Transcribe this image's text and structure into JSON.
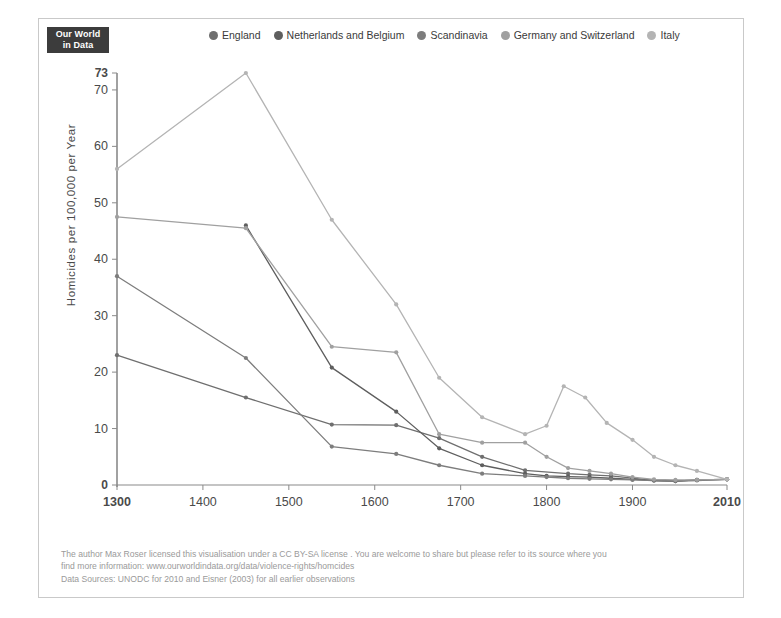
{
  "logo": {
    "line1": "Our World",
    "line2": "in Data"
  },
  "legend": {
    "position": "top",
    "items": [
      {
        "label": "England",
        "color": "#6f6f6f"
      },
      {
        "label": "Netherlands and Belgium",
        "color": "#5e5e5e"
      },
      {
        "label": "Scandinavia",
        "color": "#7d7d7d"
      },
      {
        "label": "Germany and Switzerland",
        "color": "#a0a0a0"
      },
      {
        "label": "Italy",
        "color": "#b4b4b4"
      }
    ]
  },
  "axes": {
    "ylabel": "Homicides per 100,000 per Year",
    "yticks": [
      "0",
      "10",
      "20",
      "30",
      "40",
      "50",
      "60",
      "70",
      "73"
    ],
    "xticks": [
      "1300",
      "1400",
      "1500",
      "1600",
      "1700",
      "1800",
      "1900",
      "2010"
    ]
  },
  "footer": {
    "line1": "The author Max Roser licensed this visualisation under a CC BY-SA license . You are welcome to share but please refer to its source where you",
    "line2": "find more information: www.ourworldindata.org/data/violence-rights/homcides",
    "line3": "Data Sources: UNODC for 2010 and Eisner (2003) for all earlier observations"
  },
  "chart_data": {
    "type": "line",
    "title": "",
    "xlabel": "",
    "ylabel": "Homicides per 100,000 per Year",
    "xlim": [
      1300,
      2010
    ],
    "ylim": [
      0,
      73
    ],
    "grid": false,
    "legend_position": "top",
    "yticks": [
      0,
      10,
      20,
      30,
      40,
      50,
      60,
      70,
      73
    ],
    "xticks": [
      1300,
      1400,
      1500,
      1600,
      1700,
      1800,
      1900,
      2010
    ],
    "series": [
      {
        "name": "England",
        "color": "#6f6f6f",
        "points": [
          [
            1300,
            23.0
          ],
          [
            1450,
            15.5
          ],
          [
            1550,
            10.7
          ],
          [
            1625,
            10.6
          ],
          [
            1675,
            8.3
          ],
          [
            1725,
            5.0
          ],
          [
            1775,
            2.6
          ],
          [
            1825,
            2.0
          ],
          [
            1850,
            1.8
          ],
          [
            1875,
            1.6
          ],
          [
            1900,
            1.2
          ],
          [
            1925,
            0.8
          ],
          [
            1950,
            0.7
          ],
          [
            1975,
            0.8
          ],
          [
            2010,
            1.0
          ]
        ]
      },
      {
        "name": "Netherlands and Belgium",
        "color": "#5e5e5e",
        "points": [
          [
            1450,
            46.0
          ],
          [
            1550,
            20.8
          ],
          [
            1625,
            13.0
          ],
          [
            1675,
            6.5
          ],
          [
            1725,
            3.5
          ],
          [
            1775,
            2.0
          ],
          [
            1800,
            1.6
          ],
          [
            1825,
            1.5
          ],
          [
            1850,
            1.4
          ],
          [
            1875,
            1.2
          ],
          [
            1900,
            1.0
          ],
          [
            1925,
            0.8
          ],
          [
            1950,
            0.7
          ],
          [
            1975,
            0.9
          ],
          [
            2010,
            1.0
          ]
        ]
      },
      {
        "name": "Scandinavia",
        "color": "#7d7d7d",
        "points": [
          [
            1300,
            37.0
          ],
          [
            1450,
            22.5
          ],
          [
            1550,
            6.8
          ],
          [
            1625,
            5.5
          ],
          [
            1675,
            3.5
          ],
          [
            1725,
            2.0
          ],
          [
            1775,
            1.6
          ],
          [
            1800,
            1.4
          ],
          [
            1825,
            1.2
          ],
          [
            1850,
            1.1
          ],
          [
            1875,
            1.0
          ],
          [
            1900,
            0.9
          ],
          [
            1925,
            0.8
          ],
          [
            1950,
            0.7
          ],
          [
            1975,
            0.9
          ],
          [
            2010,
            1.0
          ]
        ]
      },
      {
        "name": "Germany and Switzerland",
        "color": "#a0a0a0",
        "points": [
          [
            1300,
            47.5
          ],
          [
            1450,
            45.5
          ],
          [
            1550,
            24.5
          ],
          [
            1625,
            23.5
          ],
          [
            1675,
            9.0
          ],
          [
            1725,
            7.5
          ],
          [
            1775,
            7.5
          ],
          [
            1800,
            5.0
          ],
          [
            1825,
            3.0
          ],
          [
            1850,
            2.5
          ],
          [
            1875,
            2.0
          ],
          [
            1900,
            1.4
          ],
          [
            1925,
            1.0
          ],
          [
            1950,
            0.9
          ],
          [
            1975,
            0.9
          ],
          [
            2010,
            1.0
          ]
        ]
      },
      {
        "name": "Italy",
        "color": "#b4b4b4",
        "points": [
          [
            1300,
            56.0
          ],
          [
            1450,
            73.0
          ],
          [
            1550,
            47.0
          ],
          [
            1625,
            32.0
          ],
          [
            1675,
            19.0
          ],
          [
            1725,
            12.0
          ],
          [
            1775,
            9.0
          ],
          [
            1800,
            10.5
          ],
          [
            1820,
            17.5
          ],
          [
            1845,
            15.5
          ],
          [
            1870,
            11.0
          ],
          [
            1900,
            8.0
          ],
          [
            1925,
            5.0
          ],
          [
            1950,
            3.5
          ],
          [
            1975,
            2.5
          ],
          [
            2010,
            1.0
          ]
        ]
      }
    ]
  }
}
